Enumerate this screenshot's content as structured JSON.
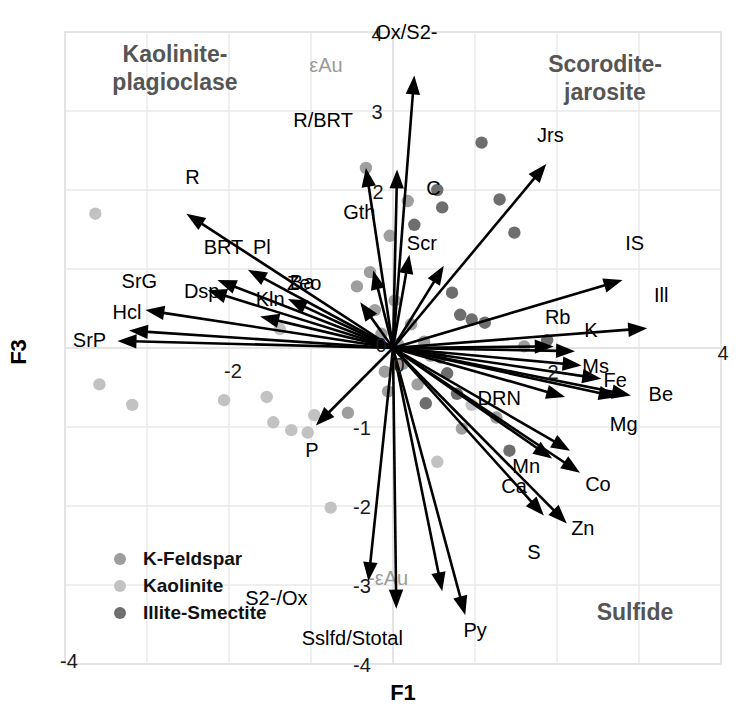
{
  "axes": {
    "x_title": "F1",
    "y_title": "F3",
    "x_ticks": [
      {
        "label": "-4",
        "value": -4
      },
      {
        "label": "-2",
        "value": -2
      },
      {
        "label": "2",
        "value": 2
      },
      {
        "label": "4",
        "value": 4
      }
    ],
    "y_ticks": [
      {
        "label": "4",
        "value": 4
      },
      {
        "label": "3",
        "value": 3
      },
      {
        "label": "2",
        "value": 2
      },
      {
        "label": "0",
        "value": 0
      },
      {
        "label": "-1",
        "value": -1
      },
      {
        "label": "-2",
        "value": -2
      },
      {
        "label": "-3",
        "value": -3
      },
      {
        "label": "-4",
        "value": -4
      }
    ],
    "origin_label": "0",
    "x_range": [
      -4.4,
      4.4
    ],
    "y_range": [
      -4.3,
      4.2
    ]
  },
  "quadrant_titles": [
    {
      "text_line1": "Kaolinite-",
      "text_line2": "plagioclase",
      "x": 175,
      "y": 62
    },
    {
      "text_line1": "Scorodite-",
      "text_line2": "jarosite",
      "x": 605,
      "y": 72
    },
    {
      "text_line1": "Sulfide",
      "text_line2": "",
      "x": 635,
      "y": 620
    }
  ],
  "legend": {
    "items": [
      {
        "label": "K-Feldspar",
        "color": "#9e9e9e"
      },
      {
        "label": "Kaolinite",
        "color": "#c2c2c2"
      },
      {
        "label": "Illite-Smectite",
        "color": "#6e6e6e"
      }
    ]
  },
  "chart_data": {
    "type": "scatter",
    "title": "",
    "xlabel": "F1",
    "ylabel": "F3",
    "xlim": [
      -4.4,
      4.4
    ],
    "ylim": [
      -4.3,
      4.2
    ],
    "grid": true,
    "legend_position": "bottom-left",
    "annotations": [
      "Kaolinite-plagioclase",
      "Scorodite-jarosite",
      "Sulfide"
    ],
    "vectors": [
      {
        "label": "Ox/S2-",
        "x": 0.26,
        "y": 3.45,
        "label_dx": -8,
        "label_dy": -36,
        "gray": false
      },
      {
        "label": "Jrs",
        "x": 1.87,
        "y": 2.33,
        "label_dx": 4,
        "label_dy": -22,
        "gray": false
      },
      {
        "label": "Scr",
        "x": 0.62,
        "y": 1.04,
        "label_dx": -22,
        "label_dy": -16,
        "gray": false
      },
      {
        "label": "C",
        "x": 0.2,
        "y": 1.18,
        "label_dx": 24,
        "label_dy": -60,
        "gray": false
      },
      {
        "label": "IS",
        "x": 2.8,
        "y": 0.86,
        "label_dx": 12,
        "label_dy": -30,
        "gray": false
      },
      {
        "label": "Ill",
        "x": 3.1,
        "y": 0.25,
        "label_dx": 14,
        "label_dy": -26,
        "gray": false
      },
      {
        "label": "R/BRT",
        "x": 0.05,
        "y": 2.26,
        "label_dx": -74,
        "label_dy": -42,
        "gray": false
      },
      {
        "label": "Gth",
        "x": -0.24,
        "y": 0.98,
        "label_dx": -14,
        "label_dy": -52,
        "gray": false
      },
      {
        "label": "Zeo",
        "x": -0.4,
        "y": 0.58,
        "label_dx": -56,
        "label_dy": -12,
        "gray": false
      },
      {
        "label": "Ba",
        "x": -1.28,
        "y": 0.62,
        "label_dx": 14,
        "label_dy": -10,
        "gray": false
      },
      {
        "label": "R",
        "x": -2.52,
        "y": 1.7,
        "label_dx": 6,
        "label_dy": -30,
        "gray": false
      },
      {
        "label": "Pl",
        "x": -1.77,
        "y": 0.99,
        "label_dx": 14,
        "label_dy": -16,
        "gray": false
      },
      {
        "label": "BRT",
        "x": -2.14,
        "y": 0.86,
        "label_dx": 6,
        "label_dy": -26,
        "gray": false
      },
      {
        "label": "Dsp",
        "x": -2.26,
        "y": 0.73,
        "label_dx": -6,
        "label_dy": 8,
        "gray": false
      },
      {
        "label": "Kln",
        "x": -1.62,
        "y": 0.4,
        "label_dx": 10,
        "label_dy": -10,
        "gray": false
      },
      {
        "label": "SrG",
        "x": -3.02,
        "y": 0.48,
        "label_dx": -6,
        "label_dy": -22,
        "gray": false
      },
      {
        "label": "Hcl",
        "x": -3.22,
        "y": 0.22,
        "label_dx": -2,
        "label_dy": -12,
        "gray": false
      },
      {
        "label": "SrP",
        "x": -3.36,
        "y": 0.09,
        "label_dx": -28,
        "label_dy": 6,
        "gray": false
      },
      {
        "label": "Rb",
        "x": 1.96,
        "y": 0.02,
        "label_dx": 4,
        "label_dy": -22,
        "gray": false
      },
      {
        "label": "K",
        "x": 2.22,
        "y": -0.04,
        "label_dx": 16,
        "label_dy": -14,
        "gray": false
      },
      {
        "label": "Ms",
        "x": 2.3,
        "y": -0.22,
        "label_dx": 14,
        "label_dy": 8,
        "gray": false
      },
      {
        "label": "Fe",
        "x": 2.54,
        "y": -0.39,
        "label_dx": 14,
        "label_dy": 8,
        "gray": false
      },
      {
        "label": "Be",
        "x": 2.9,
        "y": -0.6,
        "label_dx": 30,
        "label_dy": 6,
        "gray": false
      },
      {
        "label": "Mg",
        "x": 2.74,
        "y": -0.62,
        "label_dx": 6,
        "label_dy": 34,
        "gray": false
      },
      {
        "label": "DRN",
        "x": 2.1,
        "y": -0.62,
        "label_dx": -66,
        "label_dy": 8,
        "gray": false
      },
      {
        "label": "Mn",
        "x": 2.16,
        "y": -1.3,
        "label_dx": -44,
        "label_dy": 22,
        "gray": false
      },
      {
        "label": "Co",
        "x": 2.28,
        "y": -1.58,
        "label_dx": 18,
        "label_dy": 18,
        "gray": false
      },
      {
        "label": "Ca",
        "x": 1.94,
        "y": -1.4,
        "label_dx": -38,
        "label_dy": 34,
        "gray": false
      },
      {
        "label": "Zn",
        "x": 2.12,
        "y": -2.22,
        "label_dx": 16,
        "label_dy": 12,
        "gray": false
      },
      {
        "label": "S",
        "x": 1.84,
        "y": -2.12,
        "label_dx": -10,
        "label_dy": 44,
        "gray": false
      },
      {
        "label": "Py",
        "x": 0.88,
        "y": -3.38,
        "label_dx": 10,
        "label_dy": 22,
        "gray": false
      },
      {
        "label": "-εAu",
        "x": 0.6,
        "y": -3.08,
        "label_dx": -54,
        "label_dy": -6,
        "gray": true
      },
      {
        "label": "Sslfd/Stotal",
        "x": 0.04,
        "y": -3.3,
        "label_dx": -44,
        "label_dy": 36,
        "gray": false
      },
      {
        "label": "S2-/Ox",
        "x": -0.3,
        "y": -2.95,
        "label_dx": -92,
        "label_dy": 24,
        "gray": false
      },
      {
        "label": "P",
        "x": -0.94,
        "y": -0.98,
        "label_dx": -4,
        "label_dy": 32,
        "gray": false
      },
      {
        "label": "εAu",
        "x": -0.33,
        "y": 2.28,
        "label_dx": -40,
        "label_dy": -96,
        "gray": true
      }
    ],
    "scatter": [
      {
        "series": "Kaolinite",
        "x": -3.63,
        "y": 1.7
      },
      {
        "series": "Kaolinite",
        "x": -3.58,
        "y": -0.46
      },
      {
        "series": "Kaolinite",
        "x": -3.18,
        "y": -0.72
      },
      {
        "series": "Kaolinite",
        "x": -2.06,
        "y": -0.66
      },
      {
        "series": "Kaolinite",
        "x": -1.54,
        "y": -0.62
      },
      {
        "series": "Kaolinite",
        "x": -1.46,
        "y": -0.94
      },
      {
        "series": "Kaolinite",
        "x": -1.24,
        "y": -1.04
      },
      {
        "series": "Kaolinite",
        "x": -1.04,
        "y": -1.07
      },
      {
        "series": "Kaolinite",
        "x": -1.38,
        "y": 0.24
      },
      {
        "series": "Kaolinite",
        "x": -0.96,
        "y": -0.85
      },
      {
        "series": "Kaolinite",
        "x": -0.76,
        "y": -2.02
      },
      {
        "series": "K-Feldspar",
        "x": -0.55,
        "y": -0.82
      },
      {
        "series": "K-Feldspar",
        "x": -0.44,
        "y": 0.78
      },
      {
        "series": "K-Feldspar",
        "x": -0.33,
        "y": 2.28
      },
      {
        "series": "K-Feldspar",
        "x": -0.28,
        "y": 0.96
      },
      {
        "series": "K-Feldspar",
        "x": -0.22,
        "y": 0.48
      },
      {
        "series": "K-Feldspar",
        "x": -0.14,
        "y": 0.18
      },
      {
        "series": "K-Feldspar",
        "x": -0.1,
        "y": -0.3
      },
      {
        "series": "K-Feldspar",
        "x": -0.06,
        "y": -0.55
      },
      {
        "series": "K-Feldspar",
        "x": -0.04,
        "y": 1.42
      },
      {
        "series": "K-Feldspar",
        "x": 0.02,
        "y": 0.6
      },
      {
        "series": "K-Feldspar",
        "x": 0.06,
        "y": 0.05
      },
      {
        "series": "K-Feldspar",
        "x": 0.12,
        "y": -0.2
      },
      {
        "series": "K-Feldspar",
        "x": 0.18,
        "y": 1.86
      },
      {
        "series": "K-Feldspar",
        "x": 0.22,
        "y": 0.3
      },
      {
        "series": "K-Feldspar",
        "x": 0.3,
        "y": -0.46
      },
      {
        "series": "K-Feldspar",
        "x": 0.38,
        "y": 0.08
      },
      {
        "series": "K-Feldspar",
        "x": 0.46,
        "y": -0.1
      },
      {
        "series": "Illite-Smectite",
        "x": 0.26,
        "y": 1.56
      },
      {
        "series": "Illite-Smectite",
        "x": 0.54,
        "y": 2.0
      },
      {
        "series": "Illite-Smectite",
        "x": 0.6,
        "y": 1.78
      },
      {
        "series": "Illite-Smectite",
        "x": 1.08,
        "y": 2.6
      },
      {
        "series": "Illite-Smectite",
        "x": 1.3,
        "y": 1.88
      },
      {
        "series": "Illite-Smectite",
        "x": 1.48,
        "y": 1.46
      },
      {
        "series": "Illite-Smectite",
        "x": 0.72,
        "y": 0.7
      },
      {
        "series": "Illite-Smectite",
        "x": 0.82,
        "y": 0.42
      },
      {
        "series": "Illite-Smectite",
        "x": 0.96,
        "y": 0.36
      },
      {
        "series": "Illite-Smectite",
        "x": 1.12,
        "y": 0.32
      },
      {
        "series": "Illite-Smectite",
        "x": 0.58,
        "y": -0.12
      },
      {
        "series": "Illite-Smectite",
        "x": 0.66,
        "y": -0.32
      },
      {
        "series": "Illite-Smectite",
        "x": 0.4,
        "y": -0.7
      },
      {
        "series": "Illite-Smectite",
        "x": 0.78,
        "y": -0.58
      },
      {
        "series": "Illite-Smectite",
        "x": 1.42,
        "y": -1.3
      },
      {
        "series": "K-Feldspar",
        "x": 0.84,
        "y": -1.02
      },
      {
        "series": "K-Feldspar",
        "x": 1.26,
        "y": -0.88
      },
      {
        "series": "Kaolinite",
        "x": 0.54,
        "y": -1.44
      },
      {
        "series": "Kaolinite",
        "x": 0.96,
        "y": -0.72
      },
      {
        "series": "K-Feldspar",
        "x": 1.6,
        "y": 0.02
      },
      {
        "series": "Illite-Smectite",
        "x": 1.88,
        "y": 0.1
      }
    ]
  }
}
